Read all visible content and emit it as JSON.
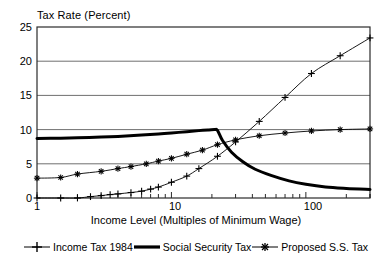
{
  "chart_data": {
    "type": "line",
    "title": "Tax Rate (Percent)",
    "xlabel": "Income Level (Multiples of Minimum Wage)",
    "ylabel": "Tax Rate (Percent)",
    "xscale": "log",
    "xlim": [
      1,
      300
    ],
    "ylim": [
      0,
      25
    ],
    "yticks": [
      0,
      5,
      10,
      15,
      20,
      25
    ],
    "ytick_labels": [
      "0",
      "5",
      "10",
      "15",
      "20",
      "25"
    ],
    "xticks": [
      1,
      10,
      100
    ],
    "xtick_labels": [
      "1",
      "10",
      "100"
    ],
    "grid": "horizontal",
    "legend_position": "below",
    "series": [
      {
        "name": "Income Tax 1984",
        "marker": "plus",
        "style": "thin-line-with-markers",
        "color": "#000000",
        "x": [
          1,
          1.5,
          2,
          2.5,
          3,
          3.5,
          4,
          5,
          6,
          7,
          8,
          10,
          13,
          16,
          22,
          30,
          45,
          70,
          110,
          180,
          300
        ],
        "y": [
          0,
          0,
          0,
          0.2,
          0.35,
          0.5,
          0.6,
          0.8,
          1.0,
          1.3,
          1.6,
          2.3,
          3.2,
          4.3,
          6.1,
          8.2,
          11.2,
          14.7,
          18.2,
          20.8,
          23.4
        ]
      },
      {
        "name": "Social Security Tax",
        "marker": "none",
        "style": "thick-line",
        "color": "#000000",
        "x": [
          1,
          1.5,
          2,
          3,
          4,
          6,
          8,
          10,
          13,
          16,
          19,
          21,
          22,
          24,
          28,
          34,
          42,
          55,
          75,
          100,
          140,
          200,
          300
        ],
        "y": [
          8.7,
          8.75,
          8.8,
          8.9,
          9.0,
          9.2,
          9.35,
          9.5,
          9.7,
          9.85,
          9.95,
          10.0,
          9.9,
          8.4,
          6.7,
          5.3,
          4.2,
          3.3,
          2.5,
          2.0,
          1.6,
          1.4,
          1.25
        ]
      },
      {
        "name": "Proposed S.S. Tax",
        "marker": "star",
        "style": "thin-line-with-markers",
        "color": "#000000",
        "x": [
          1,
          1.5,
          2,
          3,
          4,
          5,
          6.5,
          8,
          10,
          13,
          17,
          22,
          30,
          45,
          70,
          110,
          180,
          300
        ],
        "y": [
          2.9,
          3.0,
          3.5,
          3.9,
          4.3,
          4.6,
          5.0,
          5.4,
          5.8,
          6.4,
          7.0,
          7.8,
          8.5,
          9.1,
          9.5,
          9.8,
          10.0,
          10.1
        ]
      }
    ]
  },
  "legend": {
    "entries": [
      {
        "label": "Income Tax 1984",
        "symbol": "plus-line-symbol"
      },
      {
        "label": "Social Security Tax",
        "symbol": "thick-line-symbol"
      },
      {
        "label": "Proposed S.S. Tax",
        "symbol": "star-line-symbol"
      }
    ]
  },
  "axes": {
    "y_labels": [
      "25",
      "20",
      "15",
      "10",
      "5",
      "0"
    ],
    "x_labels": [
      "1",
      "10",
      "100"
    ]
  }
}
